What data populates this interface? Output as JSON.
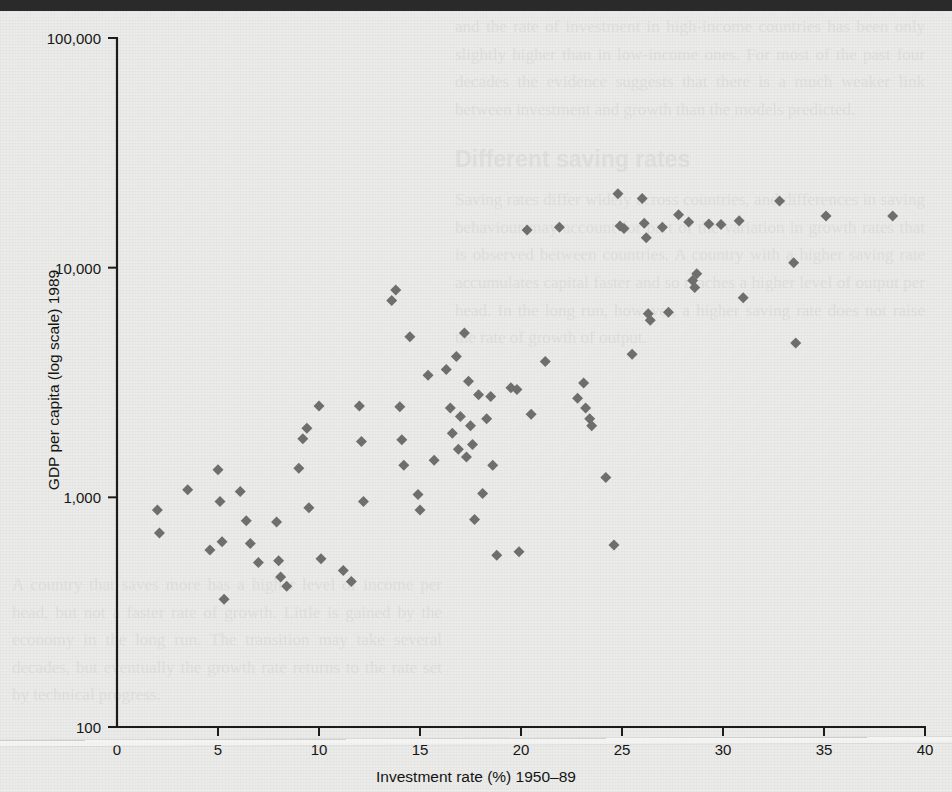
{
  "chart_data": {
    "type": "scatter",
    "title": "",
    "xlabel": "Investment rate (%) 1950–89",
    "ylabel": "GDP per capita (log scale) 1989",
    "xlim": [
      0,
      40
    ],
    "ylim": [
      100,
      100000
    ],
    "yscale": "log",
    "grid": false,
    "legend": null,
    "marker": {
      "shape": "diamond",
      "color": "#6e6e6e",
      "size": 11
    },
    "xticks": [
      0,
      5,
      10,
      15,
      20,
      25,
      30,
      35,
      40
    ],
    "xticklabels": [
      "0",
      "5",
      "10",
      "15",
      "20",
      "25",
      "30",
      "35",
      "40"
    ],
    "yticks": [
      100,
      1000,
      10000,
      100000
    ],
    "yticklabels": [
      "100",
      "1,000",
      "10,000",
      "100,000"
    ],
    "points": [
      {
        "x": 2.0,
        "y": 880
      },
      {
        "x": 2.1,
        "y": 700
      },
      {
        "x": 3.5,
        "y": 1080
      },
      {
        "x": 4.6,
        "y": 590
      },
      {
        "x": 5.0,
        "y": 1320
      },
      {
        "x": 5.1,
        "y": 960
      },
      {
        "x": 5.2,
        "y": 640
      },
      {
        "x": 5.3,
        "y": 360
      },
      {
        "x": 6.1,
        "y": 1060
      },
      {
        "x": 6.4,
        "y": 790
      },
      {
        "x": 6.6,
        "y": 630
      },
      {
        "x": 7.0,
        "y": 520
      },
      {
        "x": 7.9,
        "y": 780
      },
      {
        "x": 8.0,
        "y": 530
      },
      {
        "x": 8.1,
        "y": 450
      },
      {
        "x": 8.4,
        "y": 410
      },
      {
        "x": 9.0,
        "y": 1340
      },
      {
        "x": 9.2,
        "y": 1800
      },
      {
        "x": 9.4,
        "y": 2000
      },
      {
        "x": 9.5,
        "y": 900
      },
      {
        "x": 10.0,
        "y": 2500
      },
      {
        "x": 10.1,
        "y": 540
      },
      {
        "x": 11.2,
        "y": 480
      },
      {
        "x": 11.6,
        "y": 430
      },
      {
        "x": 12.0,
        "y": 2500
      },
      {
        "x": 12.1,
        "y": 1750
      },
      {
        "x": 12.2,
        "y": 960
      },
      {
        "x": 13.6,
        "y": 7200
      },
      {
        "x": 13.8,
        "y": 8000
      },
      {
        "x": 14.0,
        "y": 2480
      },
      {
        "x": 14.1,
        "y": 1780
      },
      {
        "x": 14.2,
        "y": 1380
      },
      {
        "x": 14.5,
        "y": 5000
      },
      {
        "x": 14.9,
        "y": 1030
      },
      {
        "x": 15.0,
        "y": 880
      },
      {
        "x": 15.4,
        "y": 3400
      },
      {
        "x": 15.7,
        "y": 1450
      },
      {
        "x": 16.3,
        "y": 3600
      },
      {
        "x": 16.5,
        "y": 2450
      },
      {
        "x": 16.6,
        "y": 1900
      },
      {
        "x": 16.8,
        "y": 4100
      },
      {
        "x": 16.9,
        "y": 1620
      },
      {
        "x": 17.0,
        "y": 2250
      },
      {
        "x": 17.2,
        "y": 5200
      },
      {
        "x": 17.3,
        "y": 1500
      },
      {
        "x": 17.4,
        "y": 3200
      },
      {
        "x": 17.5,
        "y": 2050
      },
      {
        "x": 17.6,
        "y": 1700
      },
      {
        "x": 17.7,
        "y": 800
      },
      {
        "x": 17.9,
        "y": 2800
      },
      {
        "x": 18.1,
        "y": 1040
      },
      {
        "x": 18.3,
        "y": 2200
      },
      {
        "x": 18.5,
        "y": 2750
      },
      {
        "x": 18.6,
        "y": 1380
      },
      {
        "x": 18.8,
        "y": 560
      },
      {
        "x": 19.5,
        "y": 3000
      },
      {
        "x": 19.8,
        "y": 2950
      },
      {
        "x": 19.9,
        "y": 580
      },
      {
        "x": 20.3,
        "y": 14600
      },
      {
        "x": 20.5,
        "y": 2300
      },
      {
        "x": 21.2,
        "y": 3900
      },
      {
        "x": 21.9,
        "y": 15000
      },
      {
        "x": 22.8,
        "y": 2700
      },
      {
        "x": 23.1,
        "y": 3150
      },
      {
        "x": 23.2,
        "y": 2450
      },
      {
        "x": 23.4,
        "y": 2200
      },
      {
        "x": 23.5,
        "y": 2050
      },
      {
        "x": 24.2,
        "y": 1220
      },
      {
        "x": 24.6,
        "y": 620
      },
      {
        "x": 24.8,
        "y": 21000
      },
      {
        "x": 24.9,
        "y": 15200
      },
      {
        "x": 25.1,
        "y": 14800
      },
      {
        "x": 25.5,
        "y": 4200
      },
      {
        "x": 26.0,
        "y": 20000
      },
      {
        "x": 26.1,
        "y": 15600
      },
      {
        "x": 26.2,
        "y": 13500
      },
      {
        "x": 26.3,
        "y": 6300
      },
      {
        "x": 26.4,
        "y": 5900
      },
      {
        "x": 27.0,
        "y": 15000
      },
      {
        "x": 27.3,
        "y": 6400
      },
      {
        "x": 27.8,
        "y": 17000
      },
      {
        "x": 28.3,
        "y": 15800
      },
      {
        "x": 28.5,
        "y": 8800
      },
      {
        "x": 28.6,
        "y": 8200
      },
      {
        "x": 28.7,
        "y": 9400
      },
      {
        "x": 29.3,
        "y": 15500
      },
      {
        "x": 29.9,
        "y": 15400
      },
      {
        "x": 30.8,
        "y": 16000
      },
      {
        "x": 31.0,
        "y": 7400
      },
      {
        "x": 32.8,
        "y": 19500
      },
      {
        "x": 33.5,
        "y": 10500
      },
      {
        "x": 33.6,
        "y": 4700
      },
      {
        "x": 35.1,
        "y": 16800
      },
      {
        "x": 38.4,
        "y": 16800
      }
    ]
  },
  "ghost_text": {
    "right_paragraph_top": "and the rate of investment in high-income countries has been only slightly higher than in low-income ones. For most of the past four decades the evidence suggests that there is a much weaker link between investment and growth than the models predicted.",
    "right_heading": "Different saving rates",
    "right_paragraph_mid": "Saving rates differ widely across countries, and differences in saving behaviour may account for part of the variation in growth rates that is observed between countries. A country with a higher saving rate accumulates capital faster and so reaches a higher level of output per head. In the long run, however, a higher saving rate does not raise the rate of growth of output.",
    "left_paragraph": "A country that saves more has a higher level of income per head, but not a faster rate of growth. Little is gained by the economy in the long run. The transition may take several decades, but eventually the growth rate returns to the rate set by technical progress."
  }
}
